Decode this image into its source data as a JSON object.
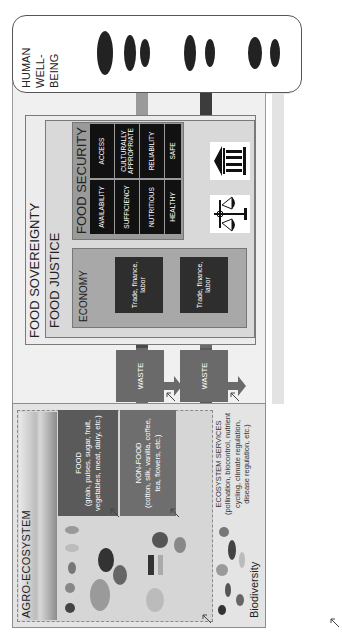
{
  "agro_ecosystem": {
    "title": "AGRO-ECOSYSTEM",
    "food": {
      "title": "FOOD",
      "detail": "(grain, pulses, sugar, fruit, vegetables, meat, dairy, etc.)"
    },
    "non_food": {
      "title": "NON-FOOD",
      "detail": "(cotton, silk, vanilla, coffee, tea, flowers, etc.)"
    },
    "ecosystem_services": {
      "title": "ECOSYSTEM SERVICES",
      "detail": "(pollination, biocontrol, nutrient cycling, climate regulation, disease regulation, etc.)"
    },
    "biodiversity_label": "Biodiversity"
  },
  "waste_boxes": [
    {
      "label": "WASTE"
    },
    {
      "label": "WASTE"
    }
  ],
  "food_sovereignty": {
    "title": "FOOD SOVEREIGNTY",
    "food_justice": {
      "title": "FOOD JUSTICE"
    }
  },
  "economy": {
    "title": "ECONOMY",
    "boxes": [
      {
        "label": "Trade, finance, labor"
      },
      {
        "label": "Trade, finance, labor"
      }
    ]
  },
  "food_security": {
    "title": "FOOD SECURITY",
    "rows": [
      [
        "ACCESS",
        "CULTURALLY APPROPRIATE",
        "RELIABILITY",
        "SAFE"
      ],
      [
        "AVAILABILITY",
        "SUFFICIENCY",
        "NUTRITIOUS",
        "HEALTHY"
      ]
    ]
  },
  "icons": [
    "institution-icon",
    "justice-scale-icon"
  ],
  "human_well_being": {
    "lines": [
      "HUMAN",
      "WELL-",
      "BEING"
    ]
  },
  "colors": {
    "arrow_medium": "#9a9a9a",
    "arrow_dark": "#3c3c3c",
    "arrow_light": "#e3e3e3",
    "waste_arrow": "#6a6a6a",
    "food_box": "#5a5a5a",
    "security_cell": "#111111"
  }
}
